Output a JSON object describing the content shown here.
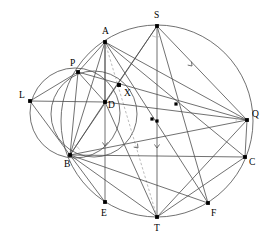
{
  "figure": {
    "stroke_color": "#4d4d4d",
    "dash_color": "#b3b3b3",
    "point_color": "#000000",
    "background": "#ffffff",
    "label_font_size": 9.5
  },
  "points": [
    {
      "id": "A",
      "label": "A",
      "x": 105.0,
      "y": 42.0,
      "lx": 102.0,
      "ly": 34.0
    },
    {
      "id": "S",
      "label": "S",
      "x": 157.0,
      "y": 26.0,
      "lx": 154.0,
      "ly": 18.0
    },
    {
      "id": "P",
      "label": "P",
      "x": 78.0,
      "y": 72.0,
      "lx": 70.0,
      "ly": 66.0
    },
    {
      "id": "L",
      "label": "L",
      "x": 30.0,
      "y": 101.0,
      "lx": 19.0,
      "ly": 98.0
    },
    {
      "id": "D",
      "label": "D",
      "x": 105.0,
      "y": 102.0,
      "lx": 108.0,
      "ly": 108.0
    },
    {
      "id": "X",
      "label": "X",
      "x": 119.0,
      "y": 85.0,
      "lx": 124.0,
      "ly": 96.0
    },
    {
      "id": "Q",
      "label": "Q",
      "x": 247.0,
      "y": 120.0,
      "lx": 252.0,
      "ly": 117.0
    },
    {
      "id": "B",
      "label": "B",
      "x": 70.0,
      "y": 155.0,
      "lx": 64.0,
      "ly": 167.0
    },
    {
      "id": "C",
      "label": "C",
      "x": 245.0,
      "y": 157.0,
      "lx": 249.0,
      "ly": 165.0
    },
    {
      "id": "E",
      "label": "E",
      "x": 105.0,
      "y": 202.0,
      "lx": 101.0,
      "ly": 216.0
    },
    {
      "id": "F",
      "label": "F",
      "x": 208.0,
      "y": 203.0,
      "lx": 211.0,
      "ly": 216.0
    },
    {
      "id": "T",
      "label": "T",
      "x": 157.0,
      "y": 217.0,
      "lx": 154.0,
      "ly": 231.0
    }
  ],
  "marker_dots": [
    {
      "name": "midpoint-dq",
      "x": 152.0,
      "y": 119.0
    },
    {
      "name": "midpoint-ax-upper",
      "x": 119.0,
      "y": 85.0
    },
    {
      "name": "midpoint-pq",
      "x": 176.0,
      "y": 104.0
    },
    {
      "name": "midpoint-st",
      "x": 157.0,
      "y": 121.0
    }
  ],
  "circles": [
    {
      "name": "main-circle",
      "cx": 157.0,
      "cy": 121.0,
      "r": 96.0
    },
    {
      "name": "left-circle",
      "cx": 75.0,
      "cy": 113.0,
      "r": 45.0
    },
    {
      "name": "inner-circle",
      "cx": 94.0,
      "cy": 114.0,
      "r": 43.0
    }
  ],
  "segments": [
    {
      "name": "seg-A-B",
      "from": "A",
      "to": "B"
    },
    {
      "name": "seg-A-D",
      "from": "A",
      "to": "D"
    },
    {
      "name": "seg-A-E",
      "from": "A",
      "to": "E"
    },
    {
      "name": "seg-A-P",
      "from": "A",
      "to": "P"
    },
    {
      "name": "seg-A-Q",
      "from": "A",
      "to": "Q"
    },
    {
      "name": "seg-A-C",
      "from": "A",
      "to": "C"
    },
    {
      "name": "seg-A-F",
      "from": "A",
      "to": "F"
    },
    {
      "name": "seg-S-T",
      "from": "S",
      "to": "T"
    },
    {
      "name": "seg-S-B",
      "from": "S",
      "to": "B"
    },
    {
      "name": "seg-S-D",
      "from": "S",
      "to": "D"
    },
    {
      "name": "seg-S-Q",
      "from": "S",
      "to": "Q"
    },
    {
      "name": "seg-S-F",
      "from": "S",
      "to": "F"
    },
    {
      "name": "seg-P-B",
      "from": "P",
      "to": "B"
    },
    {
      "name": "seg-P-D",
      "from": "P",
      "to": "D"
    },
    {
      "name": "seg-P-Q",
      "from": "P",
      "to": "Q"
    },
    {
      "name": "seg-L-D",
      "from": "L",
      "to": "D"
    },
    {
      "name": "seg-L-B",
      "from": "L",
      "to": "B"
    },
    {
      "name": "seg-L-P",
      "from": "L",
      "to": "P"
    },
    {
      "name": "seg-B-C",
      "from": "B",
      "to": "C"
    },
    {
      "name": "seg-B-D",
      "from": "B",
      "to": "D"
    },
    {
      "name": "seg-B-E",
      "from": "B",
      "to": "E"
    },
    {
      "name": "seg-B-T",
      "from": "B",
      "to": "T"
    },
    {
      "name": "seg-B-Q",
      "from": "B",
      "to": "Q"
    },
    {
      "name": "seg-B-F",
      "from": "B",
      "to": "F"
    },
    {
      "name": "seg-D-Q",
      "from": "D",
      "to": "Q"
    },
    {
      "name": "seg-D-T",
      "from": "D",
      "to": "T"
    },
    {
      "name": "seg-T-Q",
      "from": "T",
      "to": "Q"
    },
    {
      "name": "seg-T-C",
      "from": "T",
      "to": "C"
    },
    {
      "name": "seg-Q-C",
      "from": "Q",
      "to": "C"
    }
  ],
  "dashed_segments": [
    {
      "name": "dashed-A-T",
      "from": "A",
      "to": "T"
    }
  ],
  "arrow_ticks": [
    {
      "name": "tick-SQ",
      "x": 192.0,
      "y": 66.0,
      "angle": 228
    },
    {
      "name": "tick-AE-up",
      "x": 105.0,
      "y": 146.0,
      "angle": 270
    },
    {
      "name": "tick-DT-mid",
      "x": 138.0,
      "y": 148.0,
      "angle": 228
    },
    {
      "name": "tick-ST-up",
      "x": 157.0,
      "y": 148.0,
      "angle": 270
    }
  ],
  "angle_marks": [
    {
      "name": "angle-at-S",
      "x": 157.0,
      "y": 26.0,
      "start": 78,
      "end": 118,
      "r": 11
    },
    {
      "name": "angle-at-Q",
      "x": 247.0,
      "y": 120.0,
      "start": 170,
      "end": 212,
      "r": 11
    },
    {
      "name": "angle-at-B",
      "x": 70.0,
      "y": 155.0,
      "start": 290,
      "end": 330,
      "r": 11
    }
  ]
}
